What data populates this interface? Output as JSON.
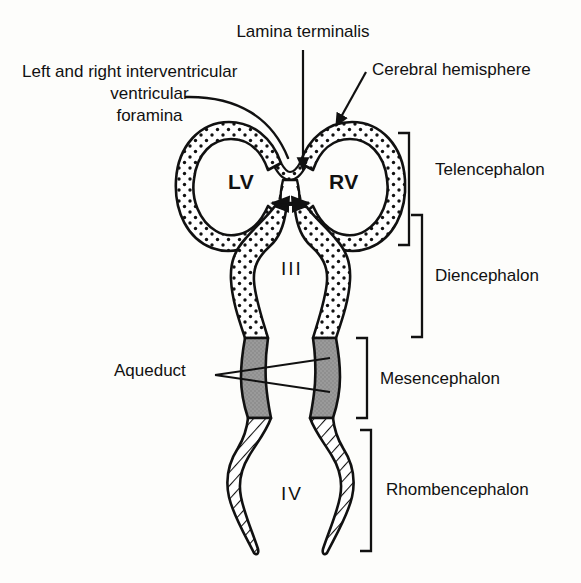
{
  "figure": {
    "colors": {
      "ink": "#111111",
      "background": "#fdfdfb",
      "mesencephalon_fill": "#9a9a9a",
      "stipple_fill": "#ffffff",
      "hatch_fill": "#ffffff"
    },
    "callouts": [
      {
        "id": "lamina-terminalis",
        "text": "Lamina terminalis",
        "leader": "vertical-arrow-down"
      },
      {
        "id": "interventricular-foramina",
        "line1": "Left and right interventricular",
        "line2": "ventricular",
        "line3": "foramina",
        "leader": "curved-line"
      },
      {
        "id": "cerebral-hemisphere",
        "text": "Cerebral hemisphere",
        "leader": "diagonal-arrow"
      },
      {
        "id": "aqueduct",
        "text": "Aqueduct",
        "leader": "two-fan-lines"
      }
    ],
    "ventricle_labels": [
      {
        "id": "lateral-ventricle-left",
        "text": "LV"
      },
      {
        "id": "lateral-ventricle-right",
        "text": "RV"
      },
      {
        "id": "third-ventricle",
        "text": "III"
      },
      {
        "id": "fourth-ventricle",
        "text": "IV"
      }
    ],
    "regions": [
      {
        "id": "telencephalon",
        "label": "Telencephalon"
      },
      {
        "id": "diencephalon",
        "label": "Diencephalon"
      },
      {
        "id": "mesencephalon",
        "label": "Mesencephalon"
      },
      {
        "id": "rhombencephalon",
        "label": "Rhombencephalon"
      }
    ]
  }
}
